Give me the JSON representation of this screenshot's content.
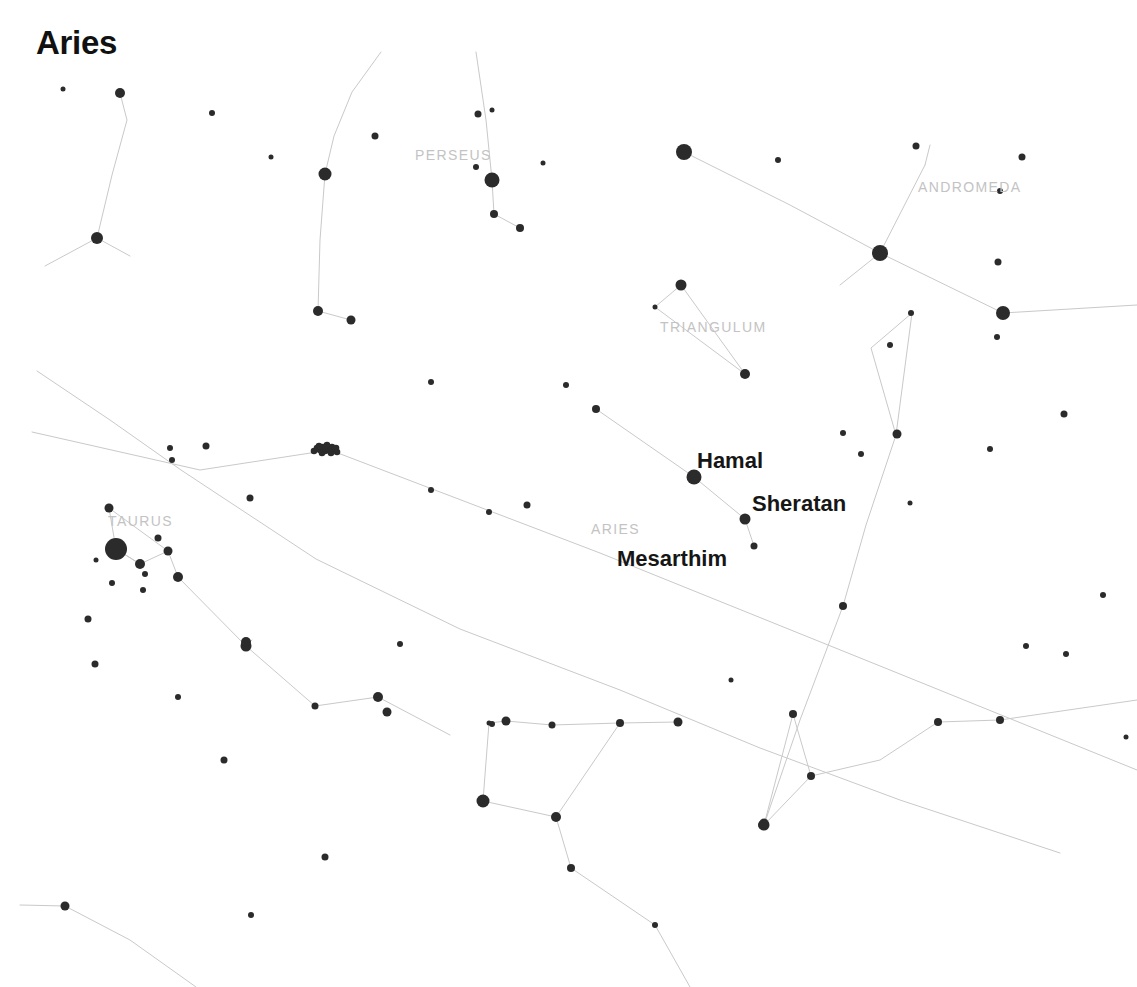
{
  "title": "Aries",
  "colors": {
    "background": "#ffffff",
    "star": "#2b2b2b",
    "line": "#c9c9c9",
    "constellation_label": "#c3c3c3",
    "star_label": "#161616",
    "title": "#111111"
  },
  "chart_data": {
    "type": "scatter",
    "title": "Aries",
    "xlabel": "",
    "ylabel": "",
    "xlim": [
      0,
      1137
    ],
    "ylim": [
      0,
      987
    ],
    "grid": false,
    "legend": "none",
    "constellation_labels": [
      {
        "name": "PERSEUS",
        "x": 415,
        "y": 147
      },
      {
        "name": "ANDROMEDA",
        "x": 918,
        "y": 179
      },
      {
        "name": "TRIANGULUM",
        "x": 660,
        "y": 319
      },
      {
        "name": "TAURUS",
        "x": 108,
        "y": 513
      },
      {
        "name": "ARIES",
        "x": 591,
        "y": 521
      }
    ],
    "star_labels": [
      {
        "name": "Hamal",
        "x": 697,
        "y": 448
      },
      {
        "name": "Sheratan",
        "x": 752,
        "y": 491
      },
      {
        "name": "Mesarthim",
        "x": 617,
        "y": 546
      }
    ],
    "named_stars": [
      {
        "name": "Hamal",
        "x": 694,
        "y": 477,
        "mag": 2.0,
        "r": 7.5
      },
      {
        "name": "Sheratan",
        "x": 745,
        "y": 519,
        "mag": 2.6,
        "r": 5.5
      },
      {
        "name": "Mesarthim",
        "x": 754,
        "y": 546,
        "mag": 3.9,
        "r": 3.5
      }
    ],
    "stars": [
      {
        "x": 120,
        "y": 93,
        "r": 5.0
      },
      {
        "x": 63,
        "y": 89,
        "r": 2.5
      },
      {
        "x": 97,
        "y": 238,
        "r": 6.0
      },
      {
        "x": 212,
        "y": 113,
        "r": 3.0
      },
      {
        "x": 271,
        "y": 157,
        "r": 2.5
      },
      {
        "x": 325,
        "y": 174,
        "r": 6.5
      },
      {
        "x": 375,
        "y": 136,
        "r": 3.5
      },
      {
        "x": 318,
        "y": 311,
        "r": 5.0
      },
      {
        "x": 351,
        "y": 320,
        "r": 4.5
      },
      {
        "x": 492,
        "y": 180,
        "r": 7.5
      },
      {
        "x": 494,
        "y": 214,
        "r": 4.0
      },
      {
        "x": 476,
        "y": 167,
        "r": 3.0
      },
      {
        "x": 478,
        "y": 114,
        "r": 3.5
      },
      {
        "x": 520,
        "y": 228,
        "r": 4.0
      },
      {
        "x": 543,
        "y": 163,
        "r": 2.5
      },
      {
        "x": 492,
        "y": 110,
        "r": 2.5
      },
      {
        "x": 684,
        "y": 152,
        "r": 8.0
      },
      {
        "x": 778,
        "y": 160,
        "r": 3.0
      },
      {
        "x": 880,
        "y": 253,
        "r": 8.0
      },
      {
        "x": 916,
        "y": 146,
        "r": 3.5
      },
      {
        "x": 1003,
        "y": 313,
        "r": 7.0
      },
      {
        "x": 1022,
        "y": 157,
        "r": 3.5
      },
      {
        "x": 1000,
        "y": 191,
        "r": 3.0
      },
      {
        "x": 998,
        "y": 262,
        "r": 3.5
      },
      {
        "x": 997,
        "y": 337,
        "r": 3.0
      },
      {
        "x": 681,
        "y": 285,
        "r": 5.5
      },
      {
        "x": 655,
        "y": 307,
        "r": 2.5
      },
      {
        "x": 745,
        "y": 374,
        "r": 5.0
      },
      {
        "x": 911,
        "y": 313,
        "r": 3.0
      },
      {
        "x": 890,
        "y": 345,
        "r": 3.0
      },
      {
        "x": 897,
        "y": 434,
        "r": 4.5
      },
      {
        "x": 843,
        "y": 433,
        "r": 3.0
      },
      {
        "x": 861,
        "y": 454,
        "r": 3.0
      },
      {
        "x": 910,
        "y": 503,
        "r": 2.5
      },
      {
        "x": 843,
        "y": 606,
        "r": 4.0
      },
      {
        "x": 596,
        "y": 409,
        "r": 4.0
      },
      {
        "x": 566,
        "y": 385,
        "r": 3.0
      },
      {
        "x": 431,
        "y": 382,
        "r": 3.0
      },
      {
        "x": 489,
        "y": 512,
        "r": 3.0
      },
      {
        "x": 527,
        "y": 505,
        "r": 3.5
      },
      {
        "x": 431,
        "y": 490,
        "r": 3.0
      },
      {
        "x": 206,
        "y": 446,
        "r": 3.5
      },
      {
        "x": 250,
        "y": 498,
        "r": 3.5
      },
      {
        "x": 170,
        "y": 448,
        "r": 3.0
      },
      {
        "x": 172,
        "y": 460,
        "r": 3.0
      },
      {
        "x": 109,
        "y": 508,
        "r": 4.5
      },
      {
        "x": 116,
        "y": 549,
        "r": 11.0
      },
      {
        "x": 158,
        "y": 538,
        "r": 3.5
      },
      {
        "x": 168,
        "y": 551,
        "r": 4.5
      },
      {
        "x": 96,
        "y": 560,
        "r": 2.5
      },
      {
        "x": 140,
        "y": 564,
        "r": 5.0
      },
      {
        "x": 145,
        "y": 574,
        "r": 3.0
      },
      {
        "x": 112,
        "y": 583,
        "r": 3.0
      },
      {
        "x": 143,
        "y": 590,
        "r": 3.0
      },
      {
        "x": 178,
        "y": 577,
        "r": 5.0
      },
      {
        "x": 88,
        "y": 619,
        "r": 3.5
      },
      {
        "x": 95,
        "y": 664,
        "r": 3.5
      },
      {
        "x": 178,
        "y": 697,
        "r": 3.0
      },
      {
        "x": 246,
        "y": 646,
        "r": 5.5
      },
      {
        "x": 246,
        "y": 642,
        "r": 5.0
      },
      {
        "x": 315,
        "y": 706,
        "r": 3.5
      },
      {
        "x": 378,
        "y": 697,
        "r": 5.0
      },
      {
        "x": 387,
        "y": 712,
        "r": 4.5
      },
      {
        "x": 224,
        "y": 760,
        "r": 3.5
      },
      {
        "x": 325,
        "y": 857,
        "r": 3.5
      },
      {
        "x": 65,
        "y": 906,
        "r": 4.5
      },
      {
        "x": 251,
        "y": 915,
        "r": 3.0
      },
      {
        "x": 400,
        "y": 644,
        "r": 3.0
      },
      {
        "x": 506,
        "y": 721,
        "r": 4.5
      },
      {
        "x": 492,
        "y": 724,
        "r": 3.0
      },
      {
        "x": 489,
        "y": 723,
        "r": 2.5
      },
      {
        "x": 552,
        "y": 725,
        "r": 3.5
      },
      {
        "x": 620,
        "y": 723,
        "r": 4.0
      },
      {
        "x": 678,
        "y": 722,
        "r": 4.5
      },
      {
        "x": 483,
        "y": 801,
        "r": 6.5
      },
      {
        "x": 556,
        "y": 817,
        "r": 5.0
      },
      {
        "x": 571,
        "y": 868,
        "r": 4.0
      },
      {
        "x": 655,
        "y": 925,
        "r": 3.0
      },
      {
        "x": 731,
        "y": 680,
        "r": 2.5
      },
      {
        "x": 793,
        "y": 714,
        "r": 4.0
      },
      {
        "x": 811,
        "y": 776,
        "r": 4.0
      },
      {
        "x": 764,
        "y": 825,
        "r": 5.5
      },
      {
        "x": 763,
        "y": 825,
        "r": 5.0
      },
      {
        "x": 764,
        "y": 823,
        "r": 4.5
      },
      {
        "x": 938,
        "y": 722,
        "r": 4.0
      },
      {
        "x": 1000,
        "y": 720,
        "r": 4.0
      },
      {
        "x": 1026,
        "y": 646,
        "r": 3.0
      },
      {
        "x": 990,
        "y": 449,
        "r": 3.0
      },
      {
        "x": 1064,
        "y": 414,
        "r": 3.5
      },
      {
        "x": 1103,
        "y": 595,
        "r": 3.0
      },
      {
        "x": 1066,
        "y": 654,
        "r": 3.0
      },
      {
        "x": 1126,
        "y": 737,
        "r": 2.5
      }
    ],
    "cluster": {
      "name": "Pleiades",
      "x": 326,
      "y": 449,
      "r": 12
    },
    "lines": [
      {
        "points": [
          [
            120,
            93
          ],
          [
            127,
            120
          ],
          [
            112,
            175
          ],
          [
            97,
            238
          ]
        ]
      },
      {
        "points": [
          [
            97,
            238
          ],
          [
            45,
            266
          ]
        ]
      },
      {
        "points": [
          [
            97,
            238
          ],
          [
            130,
            256
          ]
        ]
      },
      {
        "points": [
          [
            381,
            52
          ],
          [
            352,
            92
          ],
          [
            334,
            136
          ],
          [
            325,
            174
          ]
        ]
      },
      {
        "points": [
          [
            325,
            174
          ],
          [
            320,
            240
          ],
          [
            318,
            311
          ]
        ]
      },
      {
        "points": [
          [
            318,
            311
          ],
          [
            351,
            320
          ]
        ]
      },
      {
        "points": [
          [
            476,
            52
          ],
          [
            486,
            120
          ],
          [
            492,
            180
          ]
        ]
      },
      {
        "points": [
          [
            492,
            180
          ],
          [
            494,
            214
          ]
        ]
      },
      {
        "points": [
          [
            494,
            214
          ],
          [
            520,
            228
          ]
        ]
      },
      {
        "points": [
          [
            684,
            152
          ],
          [
            790,
            205
          ],
          [
            880,
            253
          ]
        ]
      },
      {
        "points": [
          [
            880,
            253
          ],
          [
            925,
            165
          ]
        ]
      },
      {
        "points": [
          [
            925,
            165
          ],
          [
            930,
            145
          ]
        ]
      },
      {
        "points": [
          [
            880,
            253
          ],
          [
            1003,
            313
          ]
        ]
      },
      {
        "points": [
          [
            1003,
            313
          ],
          [
            1137,
            305
          ]
        ]
      },
      {
        "points": [
          [
            840,
            285
          ],
          [
            880,
            253
          ]
        ]
      },
      {
        "points": [
          [
            681,
            285
          ],
          [
            655,
            307
          ],
          [
            745,
            374
          ],
          [
            681,
            285
          ]
        ]
      },
      {
        "points": [
          [
            596,
            409
          ],
          [
            694,
            477
          ]
        ]
      },
      {
        "points": [
          [
            694,
            477
          ],
          [
            745,
            519
          ]
        ]
      },
      {
        "points": [
          [
            745,
            519
          ],
          [
            754,
            546
          ]
        ]
      },
      {
        "points": [
          [
            912,
            313
          ],
          [
            871,
            348
          ],
          [
            896,
            435
          ]
        ]
      },
      {
        "points": [
          [
            912,
            313
          ],
          [
            896,
            435
          ]
        ]
      },
      {
        "points": [
          [
            896,
            435
          ],
          [
            866,
            525
          ],
          [
            843,
            606
          ],
          [
            800,
            720
          ],
          [
            764,
            825
          ]
        ]
      },
      {
        "points": [
          [
            764,
            825
          ],
          [
            793,
            714
          ],
          [
            811,
            776
          ]
        ]
      },
      {
        "points": [
          [
            764,
            825
          ],
          [
            811,
            776
          ],
          [
            880,
            760
          ],
          [
            938,
            722
          ],
          [
            1000,
            720
          ],
          [
            1137,
            700
          ]
        ]
      },
      {
        "points": [
          [
            37,
            371
          ],
          [
            110,
            420
          ],
          [
            181,
            470
          ],
          [
            316,
            559
          ],
          [
            460,
            629
          ],
          [
            620,
            690
          ],
          [
            760,
            748
          ],
          [
            900,
            800
          ],
          [
            1060,
            853
          ]
        ]
      },
      {
        "points": [
          [
            32,
            432
          ],
          [
            200,
            470
          ],
          [
            330,
            450
          ]
        ]
      },
      {
        "points": [
          [
            330,
            450
          ],
          [
            600,
            553
          ],
          [
            890,
            670
          ],
          [
            1137,
            770
          ]
        ]
      },
      {
        "points": [
          [
            109,
            508
          ],
          [
            116,
            549
          ]
        ]
      },
      {
        "points": [
          [
            116,
            549
          ],
          [
            140,
            564
          ],
          [
            168,
            551
          ],
          [
            109,
            508
          ]
        ]
      },
      {
        "points": [
          [
            168,
            551
          ],
          [
            178,
            577
          ]
        ]
      },
      {
        "points": [
          [
            178,
            577
          ],
          [
            246,
            646
          ],
          [
            315,
            706
          ],
          [
            378,
            697
          ]
        ]
      },
      {
        "points": [
          [
            378,
            697
          ],
          [
            450,
            735
          ]
        ]
      },
      {
        "points": [
          [
            116,
            549
          ],
          [
            140,
            564
          ]
        ]
      },
      {
        "points": [
          [
            483,
            801
          ],
          [
            489,
            723
          ],
          [
            506,
            721
          ],
          [
            552,
            725
          ]
        ]
      },
      {
        "points": [
          [
            552,
            725
          ],
          [
            620,
            723
          ]
        ]
      },
      {
        "points": [
          [
            620,
            723
          ],
          [
            678,
            722
          ]
        ]
      },
      {
        "points": [
          [
            620,
            723
          ],
          [
            556,
            817
          ]
        ]
      },
      {
        "points": [
          [
            483,
            801
          ],
          [
            556,
            817
          ]
        ]
      },
      {
        "points": [
          [
            556,
            817
          ],
          [
            571,
            868
          ],
          [
            655,
            925
          ],
          [
            690,
            987
          ]
        ]
      },
      {
        "points": [
          [
            20,
            905
          ],
          [
            65,
            906
          ],
          [
            130,
            940
          ],
          [
            196,
            987
          ]
        ]
      },
      {
        "points": [
          [
            246,
            646
          ],
          [
            252,
            640
          ]
        ]
      }
    ]
  }
}
